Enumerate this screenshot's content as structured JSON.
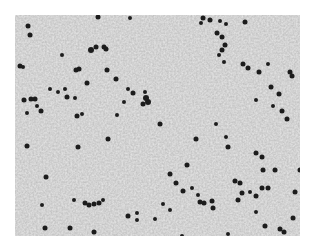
{
  "image": {
    "description": "Grayscale light micrograph of a blood smear showing a dense background of pale red blood cells with scattered dark-stained nuclei/cells",
    "background_color": "#c9c9c9",
    "cell_color": "#1e1e1e",
    "bounds": {
      "x": 15,
      "y": 15,
      "width": 285,
      "height": 221
    }
  },
  "dots": [
    [
      28,
      26,
      2.5
    ],
    [
      30,
      35,
      2.5
    ],
    [
      98,
      17,
      2.5
    ],
    [
      91,
      50,
      3
    ],
    [
      96,
      47,
      2.5
    ],
    [
      104,
      47,
      2.5
    ],
    [
      106,
      49,
      2.5
    ],
    [
      130,
      18,
      2
    ],
    [
      62,
      55,
      2
    ],
    [
      20,
      66,
      2.5
    ],
    [
      23,
      67,
      2
    ],
    [
      76,
      70,
      2.5
    ],
    [
      79,
      69,
      2.5
    ],
    [
      107,
      70,
      2.5
    ],
    [
      116,
      79,
      2.5
    ],
    [
      50,
      89,
      2
    ],
    [
      58,
      92,
      2
    ],
    [
      65,
      89,
      2
    ],
    [
      67,
      97,
      2.5
    ],
    [
      75,
      98,
      2
    ],
    [
      87,
      83,
      2.5
    ],
    [
      24,
      100,
      2.5
    ],
    [
      31,
      99,
      2.5
    ],
    [
      35,
      99,
      2.5
    ],
    [
      37,
      106,
      2
    ],
    [
      27,
      113,
      2
    ],
    [
      41,
      111,
      2.5
    ],
    [
      77,
      116,
      2.5
    ],
    [
      82,
      114,
      2
    ],
    [
      128,
      89,
      2
    ],
    [
      133,
      93,
      2.5
    ],
    [
      146,
      98,
      3
    ],
    [
      148,
      102,
      3
    ],
    [
      143,
      104,
      2.5
    ],
    [
      145,
      92,
      2
    ],
    [
      124,
      102,
      2
    ],
    [
      117,
      115,
      2
    ],
    [
      108,
      139,
      2.5
    ],
    [
      78,
      147,
      2.5
    ],
    [
      27,
      146,
      2.5
    ],
    [
      203,
      18,
      2.5
    ],
    [
      210,
      20,
      2.5
    ],
    [
      220,
      21,
      2
    ],
    [
      226,
      24,
      2
    ],
    [
      245,
      22,
      2.5
    ],
    [
      201,
      23,
      2
    ],
    [
      217,
      33,
      2.5
    ],
    [
      222,
      37,
      2.5
    ],
    [
      225,
      45,
      2.5
    ],
    [
      222,
      50,
      2.5
    ],
    [
      219,
      55,
      2
    ],
    [
      224,
      62,
      2
    ],
    [
      243,
      64,
      2.5
    ],
    [
      248,
      68,
      2.5
    ],
    [
      259,
      72,
      2.5
    ],
    [
      268,
      64,
      2
    ],
    [
      290,
      72,
      2.5
    ],
    [
      292,
      76,
      2.5
    ],
    [
      271,
      87,
      2.5
    ],
    [
      279,
      94,
      2.5
    ],
    [
      256,
      100,
      2
    ],
    [
      273,
      106,
      2
    ],
    [
      282,
      111,
      2.5
    ],
    [
      287,
      119,
      2.5
    ],
    [
      160,
      124,
      2.5
    ],
    [
      216,
      124,
      2
    ],
    [
      196,
      139,
      2.5
    ],
    [
      226,
      137,
      2
    ],
    [
      228,
      147,
      2.5
    ],
    [
      256,
      153,
      2.5
    ],
    [
      262,
      157,
      2.5
    ],
    [
      263,
      170,
      2.5
    ],
    [
      275,
      170,
      2.5
    ],
    [
      300,
      170,
      2.5
    ],
    [
      235,
      181,
      2.5
    ],
    [
      240,
      183,
      2.5
    ],
    [
      262,
      188,
      2.5
    ],
    [
      268,
      188,
      2.5
    ],
    [
      256,
      196,
      2.5
    ],
    [
      295,
      192,
      2.5
    ],
    [
      170,
      174,
      2.5
    ],
    [
      187,
      165,
      2.5
    ],
    [
      176,
      183,
      2.5
    ],
    [
      183,
      191,
      2.5
    ],
    [
      198,
      195,
      2
    ],
    [
      192,
      188,
      2
    ],
    [
      200,
      202,
      2.5
    ],
    [
      204,
      203,
      2.5
    ],
    [
      213,
      208,
      2.5
    ],
    [
      212,
      201,
      2.5
    ],
    [
      242,
      193,
      2.5
    ],
    [
      250,
      192,
      2
    ],
    [
      238,
      200,
      2.5
    ],
    [
      256,
      212,
      2
    ],
    [
      137,
      213,
      2
    ],
    [
      137,
      220,
      2
    ],
    [
      85,
      203,
      2.5
    ],
    [
      89,
      205,
      2.5
    ],
    [
      94,
      204,
      2.5
    ],
    [
      99,
      203,
      2.5
    ],
    [
      103,
      200,
      2
    ],
    [
      128,
      216,
      2.5
    ],
    [
      70,
      228,
      2.5
    ],
    [
      94,
      232,
      2.5
    ],
    [
      45,
      228,
      2.5
    ],
    [
      182,
      236,
      2
    ],
    [
      228,
      234,
      2
    ],
    [
      265,
      226,
      2.5
    ],
    [
      280,
      229,
      2.5
    ],
    [
      284,
      232,
      2.5
    ],
    [
      293,
      218,
      2.5
    ],
    [
      46,
      177,
      2.5
    ],
    [
      74,
      200,
      2
    ],
    [
      42,
      205,
      2
    ],
    [
      163,
      204,
      2
    ],
    [
      170,
      210,
      2
    ],
    [
      155,
      219,
      2
    ]
  ]
}
